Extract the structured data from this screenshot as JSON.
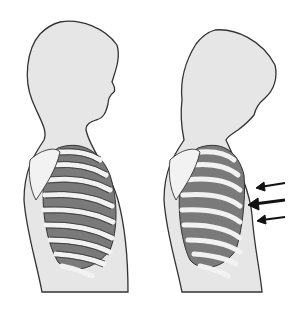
{
  "figure": {
    "colors": {
      "background": "#ffffff",
      "skin": "#e6e6e6",
      "outline": "#333333",
      "rib": "#f2f2f2",
      "intercostal": "#7a7a7a",
      "arrow": "#111111"
    },
    "figures": [
      {
        "id": "normal",
        "label": ""
      },
      {
        "id": "retracted",
        "label": "",
        "arrows": 3
      }
    ]
  }
}
